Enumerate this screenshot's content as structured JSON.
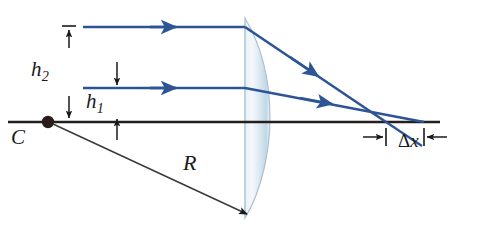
{
  "figure": {
    "background_color": "#ffffff"
  },
  "colors": {
    "ray": "#2d5596",
    "axis": "#221f1d",
    "dimension": "#1a1a1a",
    "lens_fill_light": "#eef3f8",
    "lens_fill_mid": "#cfdeea",
    "lens_edge": "#9fb6c9"
  },
  "labels": {
    "h2": {
      "base": "h",
      "sub": "2",
      "text": "h₂"
    },
    "h1": {
      "base": "h",
      "sub": "1",
      "text": "h₁"
    },
    "center_of_curvature": "C",
    "radius": "R",
    "delta_x": {
      "delta": "Δ",
      "var": "x",
      "text": "Δx"
    }
  },
  "elements": {
    "optical_axis": "optical-axis",
    "lens": "plano-convex-lens",
    "incident_ray_upper": "incident-ray-upper",
    "incident_ray_lower": "incident-ray-lower",
    "refracted_ray_upper": "refracted-ray-upper",
    "refracted_ray_lower": "refracted-ray-lower",
    "radius_line": "radius-line",
    "center_dot": "center-of-curvature-dot",
    "dimension_h2": "height-dimension-h2",
    "dimension_h1": "height-dimension-h1",
    "dimension_dx": "longitudinal-aberration-dimension"
  },
  "geometry": {
    "axis_y": 122,
    "axis_x_start": 8,
    "axis_x_end": 440,
    "center_C": {
      "x": 48,
      "y": 122
    },
    "lens_flat_x": 245,
    "lens_top_y": 18,
    "lens_bottom_y": 218,
    "lens_bulge_x": 268,
    "upper_ray_y": 27,
    "lower_ray_y": 88,
    "ray_start_x": 83,
    "upper_focus_x": 386,
    "lower_focus_x": 424,
    "delta_x_tick_left": 386,
    "delta_x_tick_right": 424
  }
}
